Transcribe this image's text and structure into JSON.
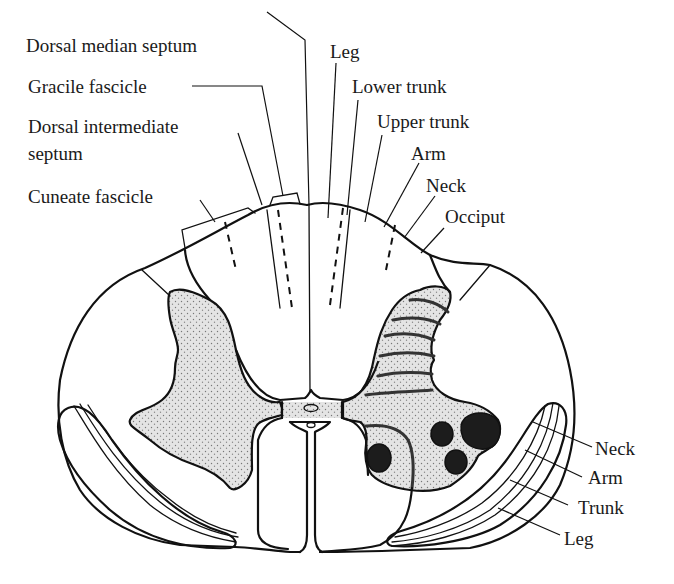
{
  "figure": {
    "colors": {
      "outline": "#111111",
      "gray_matter_fill": "#dcdcdc",
      "motor_nuclei": "#1c1c1c",
      "background": "#ffffff"
    }
  },
  "labels": {
    "left": {
      "dorsal_median_septum": "Dorsal median septum",
      "gracile_fascicle": "Gracile fascicle",
      "dorsal_intermediate_septum_line1": "Dorsal intermediate",
      "dorsal_intermediate_septum_line2": "septum",
      "cuneate_fascicle": "Cuneate fascicle"
    },
    "dorsal_column_somatotopy": {
      "leg": "Leg",
      "lower_trunk": "Lower trunk",
      "upper_trunk": "Upper trunk",
      "arm": "Arm",
      "neck": "Neck",
      "occiput": "Occiput"
    },
    "lateral_tract_somatotopy": {
      "neck": "Neck",
      "arm": "Arm",
      "trunk": "Trunk",
      "leg": "Leg"
    }
  }
}
